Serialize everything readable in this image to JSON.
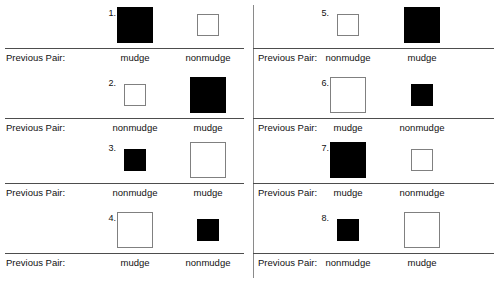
{
  "sheet": {
    "caption_label": "Previous Pair:",
    "colors": {
      "mudge_fill": "#000000",
      "nonmudge_fill": "#ffffff",
      "nonmudge_stroke": "#808080",
      "rule": "#4d4d4d",
      "divider": "#8a8a8a",
      "text": "#111111",
      "background": "#ffffff"
    }
  },
  "columns": [
    {
      "name": "left-column",
      "items": [
        {
          "number": "1.",
          "left_square": {
            "fill": "black",
            "size": "large",
            "icon": "filled-square-icon"
          },
          "right_square": {
            "fill": "white",
            "size": "small",
            "icon": "outlined-square-icon"
          },
          "caption_label": "Previous Pair:",
          "left_word": "mudge",
          "right_word": "nonmudge"
        },
        {
          "number": "2.",
          "left_square": {
            "fill": "white",
            "size": "small",
            "icon": "outlined-square-icon"
          },
          "right_square": {
            "fill": "black",
            "size": "large",
            "icon": "filled-square-icon"
          },
          "caption_label": "Previous Pair:",
          "left_word": "nonmudge",
          "right_word": "mudge"
        },
        {
          "number": "3.",
          "left_square": {
            "fill": "black",
            "size": "small",
            "icon": "filled-square-icon"
          },
          "right_square": {
            "fill": "white",
            "size": "large",
            "icon": "outlined-square-icon"
          },
          "caption_label": "Previous Pair:",
          "left_word": "nonmudge",
          "right_word": "mudge"
        },
        {
          "number": "4.",
          "left_square": {
            "fill": "white",
            "size": "large",
            "icon": "outlined-square-icon"
          },
          "right_square": {
            "fill": "black",
            "size": "small",
            "icon": "filled-square-icon"
          },
          "caption_label": "Previous Pair:",
          "left_word": "mudge",
          "right_word": "nonmudge"
        }
      ]
    },
    {
      "name": "right-column",
      "items": [
        {
          "number": "5.",
          "left_square": {
            "fill": "white",
            "size": "small",
            "icon": "outlined-square-icon"
          },
          "right_square": {
            "fill": "black",
            "size": "large",
            "icon": "filled-square-icon"
          },
          "caption_label": "Previous Pair:",
          "left_word": "nonmudge",
          "right_word": "mudge"
        },
        {
          "number": "6.",
          "left_square": {
            "fill": "white",
            "size": "large",
            "icon": "outlined-square-icon"
          },
          "right_square": {
            "fill": "black",
            "size": "small",
            "icon": "filled-square-icon"
          },
          "caption_label": "Previous Pair:",
          "left_word": "mudge",
          "right_word": "nonmudge"
        },
        {
          "number": "7.",
          "left_square": {
            "fill": "black",
            "size": "large",
            "icon": "filled-square-icon"
          },
          "right_square": {
            "fill": "white",
            "size": "small",
            "icon": "outlined-square-icon"
          },
          "caption_label": "Previous Pair:",
          "left_word": "mudge",
          "right_word": "nonmudge"
        },
        {
          "number": "8.",
          "left_square": {
            "fill": "black",
            "size": "small",
            "icon": "filled-square-icon"
          },
          "right_square": {
            "fill": "white",
            "size": "large",
            "icon": "outlined-square-icon"
          },
          "caption_label": "Previous Pair:",
          "left_word": "nonmudge",
          "right_word": "mudge"
        }
      ]
    }
  ]
}
